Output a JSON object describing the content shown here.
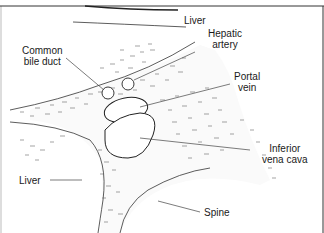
{
  "diagram": {
    "type": "anatomical line drawing",
    "colors": {
      "line": "#222222",
      "stipple": "#555555",
      "background": "#ffffff"
    },
    "labels": [
      {
        "id": "liver_top",
        "text": "Liver"
      },
      {
        "id": "common_bile_duct",
        "line1": "Common",
        "line2": "bile duct"
      },
      {
        "id": "hepatic_artery",
        "line1": "Hepatic",
        "line2": "artery"
      },
      {
        "id": "portal_vein",
        "line1": "Portal",
        "line2": "vein"
      },
      {
        "id": "inferior_vena_cava",
        "line1": "Inferior",
        "line2": "vena cava"
      },
      {
        "id": "liver_left",
        "text": "Liver"
      },
      {
        "id": "spine",
        "text": "Spine"
      }
    ]
  }
}
